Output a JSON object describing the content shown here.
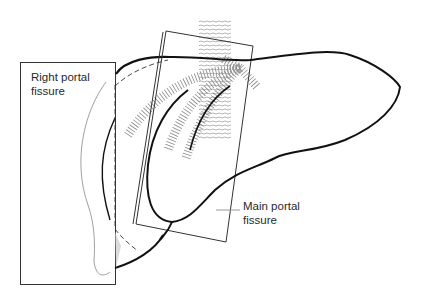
{
  "figure": {
    "labels": {
      "right_portal_fissure": {
        "line1": "Right portal",
        "line2": "fissure"
      },
      "main_portal_fissure": {
        "line1": "Main portal",
        "line2": "fissure"
      }
    },
    "colors": {
      "outline": "#111111",
      "plane": "#333333",
      "leader": "#999999",
      "vessel_hatch": "#888888",
      "text": "#2a2a2a"
    }
  }
}
